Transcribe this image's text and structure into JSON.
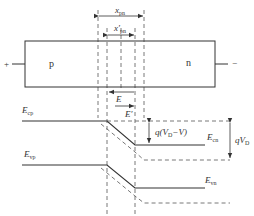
{
  "diagram": {
    "type": "pn-junction-forward-bias-band-diagram",
    "device": {
      "p_region_label": "p",
      "n_region_label": "n",
      "left_terminal": "+",
      "right_terminal": "−"
    },
    "dimensions": {
      "xpn_main": "x",
      "xpn_sub": "pn",
      "xpn_prime_main": "x′",
      "xpn_prime_sub": "pn"
    },
    "fields": {
      "E_label": "E",
      "E_prime_label": "E′"
    },
    "bands": {
      "Ecp_main": "E",
      "Ecp_sub": "cp",
      "Ecn_main": "E",
      "Ecn_sub": "cn",
      "Evp_main": "E",
      "Evp_sub": "vp",
      "Evn_main": "E",
      "Evn_sub": "vn"
    },
    "energies": {
      "barrier_forward_pre": "q(V",
      "barrier_forward_sub": "D",
      "barrier_forward_post": "−V)",
      "barrier_equilibrium_pre": "qV",
      "barrier_equilibrium_sub": "D"
    },
    "colors": {
      "line": "#333333",
      "dashed": "#555555"
    }
  }
}
